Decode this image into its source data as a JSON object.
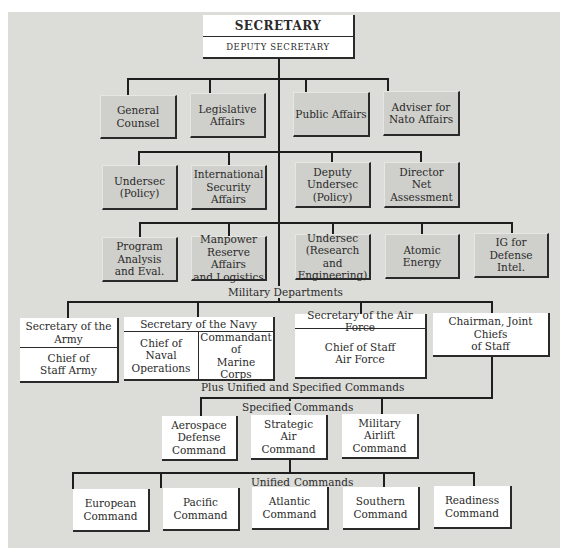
{
  "chart": {
    "top": {
      "title": "SECRETARY",
      "subtitle": "DEPUTY SECRETARY"
    },
    "row1": [
      {
        "label": "General\nCounsel"
      },
      {
        "label": "Legislative\nAffairs"
      },
      {
        "label": "Public Affairs"
      },
      {
        "label": "Adviser for\nNato Affairs"
      }
    ],
    "row2": [
      {
        "label": "Undersec\n(Policy)"
      },
      {
        "label": "International\nSecurity\nAffairs"
      },
      {
        "label": "Deputy\nUndersec\n(Policy)"
      },
      {
        "label": "Director\nNet\nAssessment"
      }
    ],
    "row3": [
      {
        "label": "Program\nAnalysis\nand Eval."
      },
      {
        "label": "Manpower\nReserve Affairs\nand Logistics"
      },
      {
        "label": "Undersec\n(Research and\nEngineering)"
      },
      {
        "label": "Atomic Energy"
      },
      {
        "label": "IG for\nDefense Intel."
      }
    ],
    "military_label": "Military Departments",
    "army": {
      "header": "Secretary of the\nArmy",
      "body": "Chief of\nStaff Army"
    },
    "navy": {
      "header": "Secretary of the Navy",
      "left": "Chief of\nNaval\nOperations",
      "right": "Commandant of\nMarine\nCorps"
    },
    "air_force": {
      "header": "Secretary of the Air Force",
      "body": "Chief of Staff\nAir Force"
    },
    "jcs": {
      "label": "Chairman, Joint Chiefs\nof Staff"
    },
    "plus_label": "Plus Unified and Specified Commands",
    "specified_label_left": "Specified",
    "specified_label_right": "Commands",
    "specified": [
      {
        "label": "Aerospace\nDefense\nCommand"
      },
      {
        "label": "Strategic\nAir\nCommand"
      },
      {
        "label": "Military\nAirlift\nCommand"
      }
    ],
    "unified_label_left": "Unified",
    "unified_label_right": "Commands",
    "unified": [
      {
        "label": "European\nCommand"
      },
      {
        "label": "Pacific\nCommand"
      },
      {
        "label": "Atlantic\nCommand"
      },
      {
        "label": "Southern\nCommand"
      },
      {
        "label": "Readiness\nCommand"
      }
    ]
  },
  "colors": {
    "panel": "#dcdcd9",
    "staff_box": "#cfcfcb",
    "line_box": "#ffffff",
    "line": "#1e1e1e"
  }
}
